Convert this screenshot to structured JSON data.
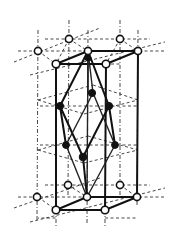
{
  "diagram": {
    "title": "",
    "colors": {
      "background": "#ffffff",
      "line": "#111111",
      "open_atom_fill": "#ffffff",
      "filled_atom_fill": "#111111"
    },
    "atoms": {
      "top_open": [
        [
          38,
          51
        ],
        [
          69,
          39
        ],
        [
          88,
          51
        ],
        [
          120,
          39
        ],
        [
          138,
          51
        ],
        [
          56,
          64
        ],
        [
          106,
          64
        ]
      ],
      "bottom_open": [
        [
          37,
          197
        ],
        [
          68,
          185
        ],
        [
          87,
          197
        ],
        [
          120,
          185
        ],
        [
          137,
          197
        ],
        [
          56,
          210
        ],
        [
          105,
          210
        ]
      ],
      "filled": [
        [
          88,
          58
        ],
        [
          93,
          93
        ],
        [
          60,
          106
        ],
        [
          109,
          106
        ],
        [
          66,
          145
        ],
        [
          115,
          145
        ],
        [
          83,
          157
        ]
      ]
    },
    "labels": []
  }
}
